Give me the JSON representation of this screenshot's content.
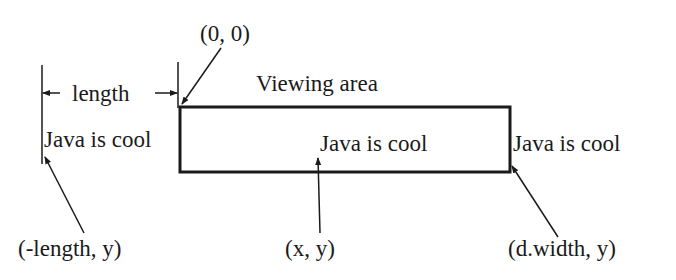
{
  "diagram": {
    "origin_label": "(0, 0)",
    "viewing_area_label": "Viewing area",
    "length_label": "length",
    "text_left": "Java is cool",
    "text_center": "Java is cool",
    "text_right": "Java is cool",
    "coord_left": "(-length, y)",
    "coord_center": "(x, y)",
    "coord_right": "(d.width, y)",
    "colors": {
      "line": "#1a1a1a",
      "background": "#ffffff"
    }
  }
}
